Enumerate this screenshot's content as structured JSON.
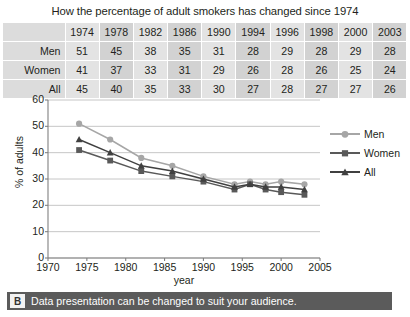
{
  "title": "How the percentage of adult smokers has changed since 1974",
  "table": {
    "corner_label": "",
    "columns": [
      "1974",
      "1978",
      "1982",
      "1986",
      "1990",
      "1994",
      "1996",
      "1998",
      "2000",
      "2003"
    ],
    "rows": [
      {
        "label": "Men",
        "values": [
          "51",
          "45",
          "38",
          "35",
          "31",
          "28",
          "29",
          "28",
          "29",
          "28"
        ]
      },
      {
        "label": "Women",
        "values": [
          "41",
          "37",
          "33",
          "31",
          "29",
          "26",
          "28",
          "26",
          "25",
          "24"
        ]
      },
      {
        "label": "All",
        "values": [
          "45",
          "40",
          "35",
          "33",
          "30",
          "27",
          "28",
          "27",
          "27",
          "26"
        ]
      }
    ]
  },
  "chart_data": {
    "type": "line",
    "title": "How the percentage of adult smokers has changed since 1974",
    "xlabel": "year",
    "ylabel": "% of adults",
    "x": [
      1974,
      1978,
      1982,
      1986,
      1990,
      1994,
      1996,
      1998,
      2000,
      2003
    ],
    "xlim": [
      1970,
      2005
    ],
    "ylim": [
      0,
      60
    ],
    "xticks": [
      1970,
      1975,
      1980,
      1985,
      1990,
      1995,
      2000,
      2005
    ],
    "yticks": [
      0,
      10,
      20,
      30,
      40,
      50,
      60
    ],
    "grid": "horizontal",
    "legend_position": "right",
    "series": [
      {
        "name": "Men",
        "marker": "circle",
        "color": "#a6a6a6",
        "values": [
          51,
          45,
          38,
          35,
          31,
          28,
          29,
          28,
          29,
          28
        ]
      },
      {
        "name": "Women",
        "marker": "square",
        "color": "#595959",
        "values": [
          41,
          37,
          33,
          31,
          29,
          26,
          28,
          26,
          25,
          24
        ]
      },
      {
        "name": "All",
        "marker": "triangle",
        "color": "#404040",
        "values": [
          45,
          40,
          35,
          33,
          30,
          27,
          28,
          27,
          27,
          26
        ]
      }
    ]
  },
  "caption": {
    "badge": "B",
    "text": "Data presentation can be changed to suit your audience."
  },
  "colors": {
    "men": "#a6a6a6",
    "women": "#595959",
    "all": "#404040",
    "grid": "#bfbfbf",
    "caption_bar": "#5b5b5b",
    "table_band": "#d2d2d2",
    "table_cell": "#e3e3e3"
  }
}
